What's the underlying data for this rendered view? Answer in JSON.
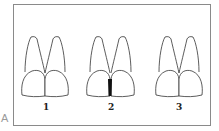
{
  "figure": {
    "panel_label": "A",
    "pairs": [
      {
        "label": "1",
        "variant": "tight contact, no gap"
      },
      {
        "label": "2",
        "variant": "open gingival embrasure (black triangle)"
      },
      {
        "label": "3",
        "variant": "tight contact, no gap"
      }
    ],
    "colors": {
      "outline": "#333333",
      "frame": "#8a8a8a",
      "black_triangle": "#111111"
    }
  }
}
